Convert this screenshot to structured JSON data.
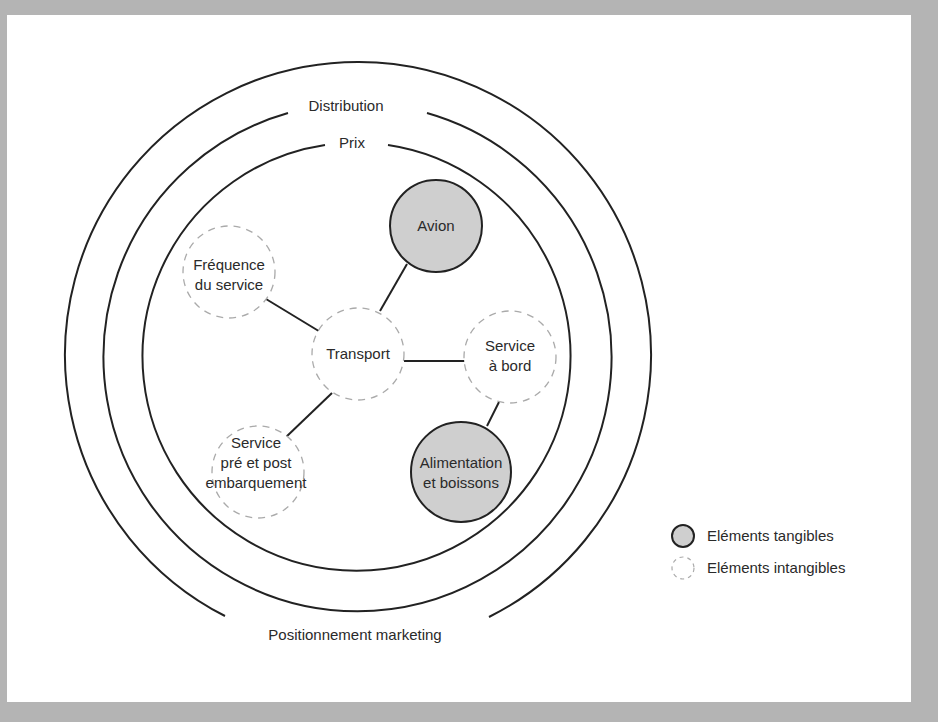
{
  "diagram": {
    "rings": {
      "outer": "Positionnement marketing",
      "middle": "Distribution",
      "inner": "Prix"
    },
    "center_node": {
      "label": "Transport",
      "type": "intangible"
    },
    "nodes": [
      {
        "id": "avion",
        "lines": [
          "Avion"
        ],
        "type": "tangible"
      },
      {
        "id": "frequence",
        "lines": [
          "Fréquence",
          "du service"
        ],
        "type": "intangible"
      },
      {
        "id": "service-bord",
        "lines": [
          "Service",
          "à bord"
        ],
        "type": "intangible"
      },
      {
        "id": "alimentation",
        "lines": [
          "Alimentation",
          "et boissons"
        ],
        "type": "tangible"
      },
      {
        "id": "service-pre-post",
        "lines": [
          "Service",
          "pré et post",
          "embarquement"
        ],
        "type": "intangible"
      }
    ],
    "edges": [
      [
        "frequence",
        "transport"
      ],
      [
        "avion",
        "transport"
      ],
      [
        "transport",
        "service-bord"
      ],
      [
        "service-bord",
        "alimentation"
      ],
      [
        "transport",
        "service-pre-post"
      ]
    ]
  },
  "legend": {
    "tangible": "Eléments tangibles",
    "intangible": "Eléments intangibles"
  },
  "colors": {
    "tangible_fill": "#cfcfcf",
    "line": "#222222",
    "dashed": "#aaaaaa",
    "frame": "#b4b4b4"
  }
}
